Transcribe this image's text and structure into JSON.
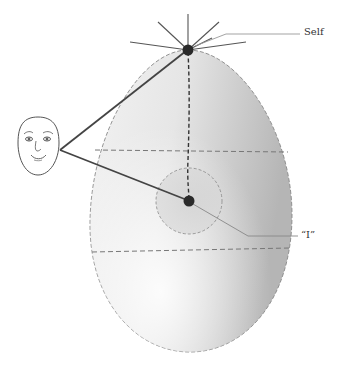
{
  "diagram": {
    "labels": {
      "self": "Self",
      "i": "“I”"
    },
    "nodes": [
      {
        "id": "self-node",
        "label": "Self",
        "cx": 188,
        "cy": 50
      },
      {
        "id": "i-node",
        "label": "“I”",
        "cx": 189,
        "cy": 201
      }
    ],
    "elements": {
      "egg": "egg-shaped body with gradient shading",
      "face": "smiling face outline",
      "rays": "radiating lines from Self node",
      "inner-circle": "dashed circle around I node",
      "horizontal-dividers": 2
    },
    "colors": {
      "line": "#444444",
      "node": "#222222",
      "egg_light": "#f4f4f4",
      "egg_dark": "#b8b8b8",
      "dash": "#777777",
      "leader": "#999999"
    }
  }
}
